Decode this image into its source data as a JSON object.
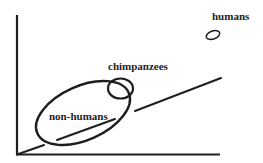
{
  "diagram": {
    "type": "conceptual-plot",
    "colors": {
      "stroke": "#1e1e1e",
      "background": "#ffffff"
    },
    "axes": {
      "x_axis": {
        "label": ""
      },
      "y_axis": {
        "label": ""
      }
    },
    "trend_line": {
      "description": "diagonal line rising from origin"
    },
    "groups": [
      {
        "id": "non-humans",
        "label": "non-humans",
        "shape": "large ellipse"
      },
      {
        "id": "chimpanzees",
        "label": "chimpanzees",
        "shape": "small circle"
      },
      {
        "id": "humans",
        "label": "humans",
        "shape": "tiny ellipse"
      }
    ]
  }
}
